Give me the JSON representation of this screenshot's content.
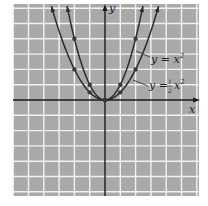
{
  "chart_data": {
    "type": "line",
    "title": "",
    "xlabel": "x",
    "ylabel": "y",
    "xlim": [
      -6,
      6
    ],
    "ylim": [
      -6,
      6.3
    ],
    "grid": true,
    "legend_position": "inline-annotations",
    "series": [
      {
        "name": "y = x^2",
        "label_text": "y = x",
        "label_sup": "2",
        "points": [
          [
            -2,
            4
          ],
          [
            -1,
            1
          ],
          [
            0,
            0
          ],
          [
            1,
            1
          ],
          [
            2,
            4
          ]
        ]
      },
      {
        "name": "y = 1/2 x^2",
        "label_text": "y = ",
        "label_frac_num": "1",
        "label_frac_den": "2",
        "label_var": "x",
        "label_sup": "2",
        "points": [
          [
            -2,
            2
          ],
          [
            -1,
            0.5
          ],
          [
            0,
            0
          ],
          [
            1,
            0.5
          ],
          [
            2,
            2
          ]
        ]
      }
    ]
  },
  "axes": {
    "x_label": "x",
    "y_label": "y"
  },
  "colors": {
    "grid_bg": "#a9a9a9",
    "grid_line": "#f2f2f2",
    "curve": "#2b2b2b",
    "axis": "#1a1a1a"
  }
}
